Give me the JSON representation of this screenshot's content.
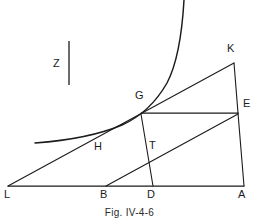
{
  "figure": {
    "caption": "Fig. IV-4-6",
    "caption_top": 207,
    "background_color": "#ffffff",
    "ink_color": "#1b1b1b",
    "width": 259,
    "height": 221
  },
  "annotations": {
    "z_label": "Z",
    "z_label_x": 53,
    "z_label_y": 58,
    "z_bar_x": 69,
    "z_bar_y1": 41,
    "z_bar_y2": 85
  },
  "vertices": {
    "L": {
      "label": "L",
      "x": 8,
      "y": 186,
      "label_x": 4,
      "label_y": 189
    },
    "B": {
      "label": "B",
      "x": 106,
      "y": 186,
      "label_x": 100,
      "label_y": 189
    },
    "D": {
      "label": "D",
      "x": 153,
      "y": 186,
      "label_x": 147,
      "label_y": 189
    },
    "A": {
      "label": "A",
      "x": 244,
      "y": 186,
      "label_x": 238,
      "label_y": 189
    },
    "G": {
      "label": "G",
      "x": 141,
      "y": 113,
      "label_x": 135,
      "label_y": 90
    },
    "H": {
      "label": "H",
      "x": 104,
      "y": 139,
      "label_x": 94,
      "label_y": 141
    },
    "T": {
      "label": "T",
      "x": 149,
      "y": 162,
      "label_x": 149,
      "label_y": 140
    },
    "K": {
      "label": "K",
      "x": 234,
      "y": 63,
      "label_x": 227,
      "label_y": 43
    },
    "E": {
      "label": "E",
      "x": 238,
      "y": 113,
      "label_x": 243,
      "label_y": 98
    }
  },
  "segments": [
    {
      "name": "baseline-L-A",
      "from": "L",
      "to": "A",
      "x1": 8,
      "y1": 186,
      "x2": 244,
      "y2": 186
    },
    {
      "name": "ray-L-G-K",
      "from": "L",
      "to": "K",
      "x1": 8,
      "y1": 186,
      "x2": 234,
      "y2": 63
    },
    {
      "name": "chord-K-E",
      "from": "K",
      "to": "E",
      "x1": 234,
      "y1": 63,
      "x2": 238,
      "y2": 113
    },
    {
      "name": "chord-G-E",
      "from": "G",
      "to": "E",
      "x1": 141,
      "y1": 113,
      "x2": 238,
      "y2": 113
    },
    {
      "name": "chord-G-D",
      "from": "G",
      "to": "D",
      "x1": 141,
      "y1": 114,
      "x2": 153,
      "y2": 186
    },
    {
      "name": "chord-B-E",
      "from": "B",
      "to": "E",
      "x1": 106,
      "y1": 186,
      "x2": 238,
      "y2": 114
    },
    {
      "name": "chord-E-A",
      "from": "E",
      "to": "A",
      "x1": 238,
      "y1": 113,
      "x2": 244,
      "y2": 186
    }
  ],
  "curve": {
    "name": "exponential-curve",
    "path": "M 35 143 C 62 141, 96 136, 122 125 C 140 117, 155 104, 167 83 C 177 64, 182 35, 184 0",
    "start_x": 35,
    "start_y": 143,
    "end_x": 184,
    "end_y": 0
  }
}
